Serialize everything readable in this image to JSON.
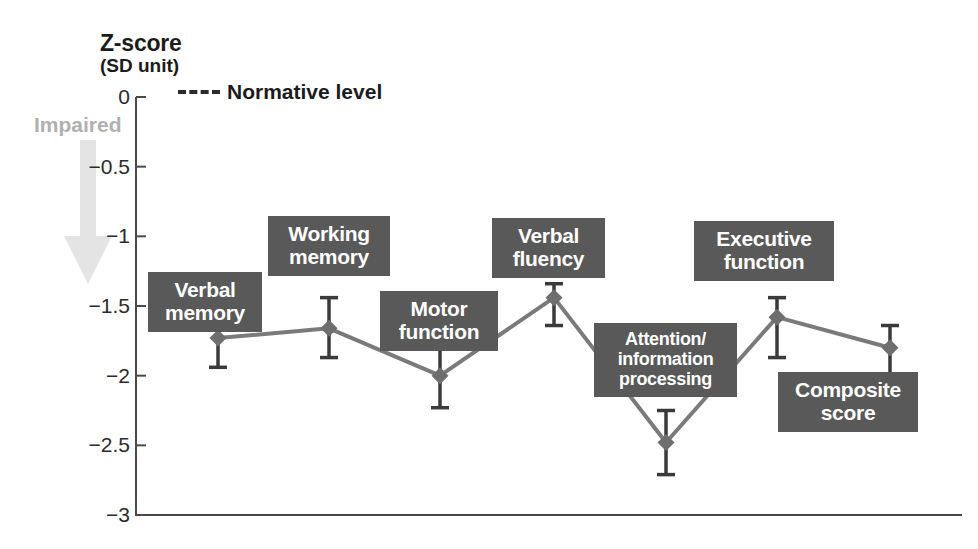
{
  "axis": {
    "title": "Z-score",
    "subtitle": "(SD unit)",
    "direction_label": "Impaired",
    "tick_labels": [
      "0",
      "−0.5",
      "−1",
      "−1.5",
      "−2",
      "−2.5",
      "−3"
    ]
  },
  "legend": {
    "normative_label": "Normative level"
  },
  "labels": {
    "verbal_memory": "Verbal\nmemory",
    "working_memory": "Working\nmemory",
    "motor_function": "Motor\nfunction",
    "verbal_fluency": "Verbal\nfluency",
    "attention": "Attention/\ninformation\nprocessing",
    "executive_function": "Executive\nfunction",
    "composite_score": "Composite\nscore"
  },
  "colors": {
    "box_fill": "#595959",
    "box_text": "#ffffff",
    "series_line": "#7a7a7a",
    "marker": "#6e6e6e",
    "error_bar": "#3a3a3a",
    "axis": "#4a4a4a",
    "impaired_text": "#b0b0b0",
    "impaired_arrow": "#e2e2e2"
  },
  "chart_data": {
    "type": "line",
    "title": "Z-score (SD unit)",
    "xlabel": "",
    "ylabel": "Z-score (SD unit)",
    "ylim": [
      -3,
      0
    ],
    "yticks": [
      0,
      -0.5,
      -1,
      -1.5,
      -2,
      -2.5,
      -3
    ],
    "grid": false,
    "legend": [
      "Normative level"
    ],
    "annotations": [
      "Impaired (downward arrow)",
      "Normative level = 0 (dashed reference)"
    ],
    "categories": [
      "Verbal memory",
      "Working memory",
      "Motor function",
      "Verbal fluency",
      "Attention/information processing",
      "Executive function",
      "Composite score"
    ],
    "values": [
      -1.73,
      -1.66,
      -2.0,
      -1.44,
      -2.48,
      -1.58,
      -1.8
    ],
    "error_low": [
      -1.94,
      -1.87,
      -2.23,
      -1.64,
      -2.71,
      -1.87,
      -2.02
    ],
    "error_high": [
      -1.61,
      -1.44,
      -1.8,
      -1.34,
      -2.25,
      -1.44,
      -1.64
    ],
    "series": [
      {
        "name": "Cognitive domain z-score",
        "values": [
          -1.73,
          -1.66,
          -2.0,
          -1.44,
          -2.48,
          -1.58,
          -1.8
        ]
      }
    ]
  }
}
